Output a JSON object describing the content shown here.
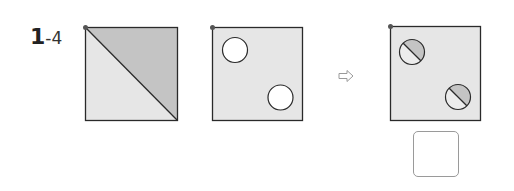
{
  "problem": {
    "number": "1",
    "sub_number": "-4"
  },
  "colors": {
    "fill_light": "#e6e6e6",
    "fill_dark": "#c4c4c4",
    "stroke": "#2a2a2a",
    "dot": "#555555",
    "arrow": "#9a9a9a",
    "answer_border": "#9a9a9a"
  },
  "figures": [
    {
      "name": "square-diagonal-split",
      "description": "Square split by diagonal, upper-right half shaded"
    },
    {
      "name": "square-two-circles",
      "description": "Square with two white circles"
    },
    {
      "name": "square-two-split-circles",
      "description": "Square with two circles each split by a diagonal, upper-right half shaded"
    }
  ],
  "arrow": {
    "icon": "right-arrow-outline-icon",
    "glyph": "⇨"
  },
  "answer_box": {
    "value": ""
  }
}
